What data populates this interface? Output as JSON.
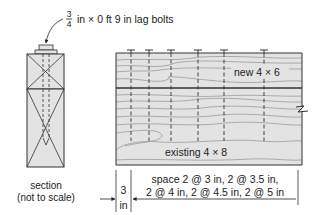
{
  "callout": {
    "fraction_num": "3",
    "fraction_den": "4",
    "text": "in × 0 ft 9 in lag bolts"
  },
  "section": {
    "caption_line1": "section",
    "caption_line2": "(not to scale)"
  },
  "elevation": {
    "new_member_label": "new 4 × 6",
    "existing_member_label": "existing 4 × 8",
    "bolt_count": 6
  },
  "dimensions": {
    "edge_value": "3",
    "edge_unit": "in",
    "spacing_line1": "space 2 @ 3 in, 2 @ 3.5 in,",
    "spacing_line2": "2 @ 4 in, 2 @ 4.5 in, 2 @ 5 in"
  },
  "colors": {
    "wood_fill": "#e3e3e3",
    "grain": "#9a9a9a",
    "line": "#333333"
  }
}
